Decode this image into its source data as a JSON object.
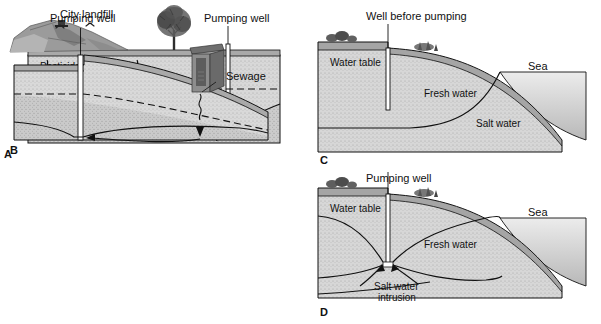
{
  "figure": {
    "background": "#ffffff",
    "panel_count": 4
  },
  "colors": {
    "ink": "#111111",
    "aquifer_unsaturated": "#dcdcdc",
    "aquifer_saturated": "#cfcfcf",
    "aquifer_deep": "#c4c4c4",
    "surface_band": "#a9a9a9",
    "hill_dark": "#8f8f8f",
    "sea_light": "#e4e4e4",
    "sea_dark": "#bdbdbd",
    "well_white": "#ffffff",
    "outhouse": "#8a8a8a"
  },
  "panels": [
    {
      "letter": "A",
      "name": "landfill-contamination",
      "labels": {
        "landfill": "City landfill",
        "contaminants": "Pesticides,",
        "contaminants2": "heavy metals, etc.",
        "water_table_before": "Water table",
        "water_table_before2": "before pumping",
        "water_table": "Water table",
        "pumping_well": "Pumping well"
      },
      "icons": [
        "birds-icon",
        "landfill-hill-icon",
        "tree-icon",
        "well-shaft-icon",
        "flow-arrow-icon",
        "infiltration-arrow-icon"
      ]
    },
    {
      "letter": "B",
      "name": "sewage-contamination",
      "labels": {
        "pumping_well": "Pumping well",
        "sewage": "Sewage"
      },
      "icons": [
        "outhouse-icon",
        "well-shaft-icon",
        "flow-arrow-icon",
        "infiltration-arrow-icon"
      ]
    },
    {
      "letter": "C",
      "name": "coastal-aquifer-before-pumping",
      "labels": {
        "well_before_pumping": "Well before pumping",
        "water_table": "Water table",
        "fresh_water": "Fresh water",
        "salt_water": "Salt water",
        "sea": "Sea"
      },
      "icons": [
        "shrub-icon",
        "well-shaft-icon",
        "interface-curve-icon"
      ]
    },
    {
      "letter": "D",
      "name": "saltwater-intrusion-during-pumping",
      "labels": {
        "pumping_well": "Pumping well",
        "water_table": "Water table",
        "fresh_water": "Fresh water",
        "salt_water_intrusion": "Salt water",
        "salt_water_intrusion2": "intrusion",
        "sea": "Sea"
      },
      "icons": [
        "shrub-icon",
        "well-shaft-icon",
        "intrusion-arrow-icon",
        "interface-curve-icon"
      ]
    }
  ]
}
